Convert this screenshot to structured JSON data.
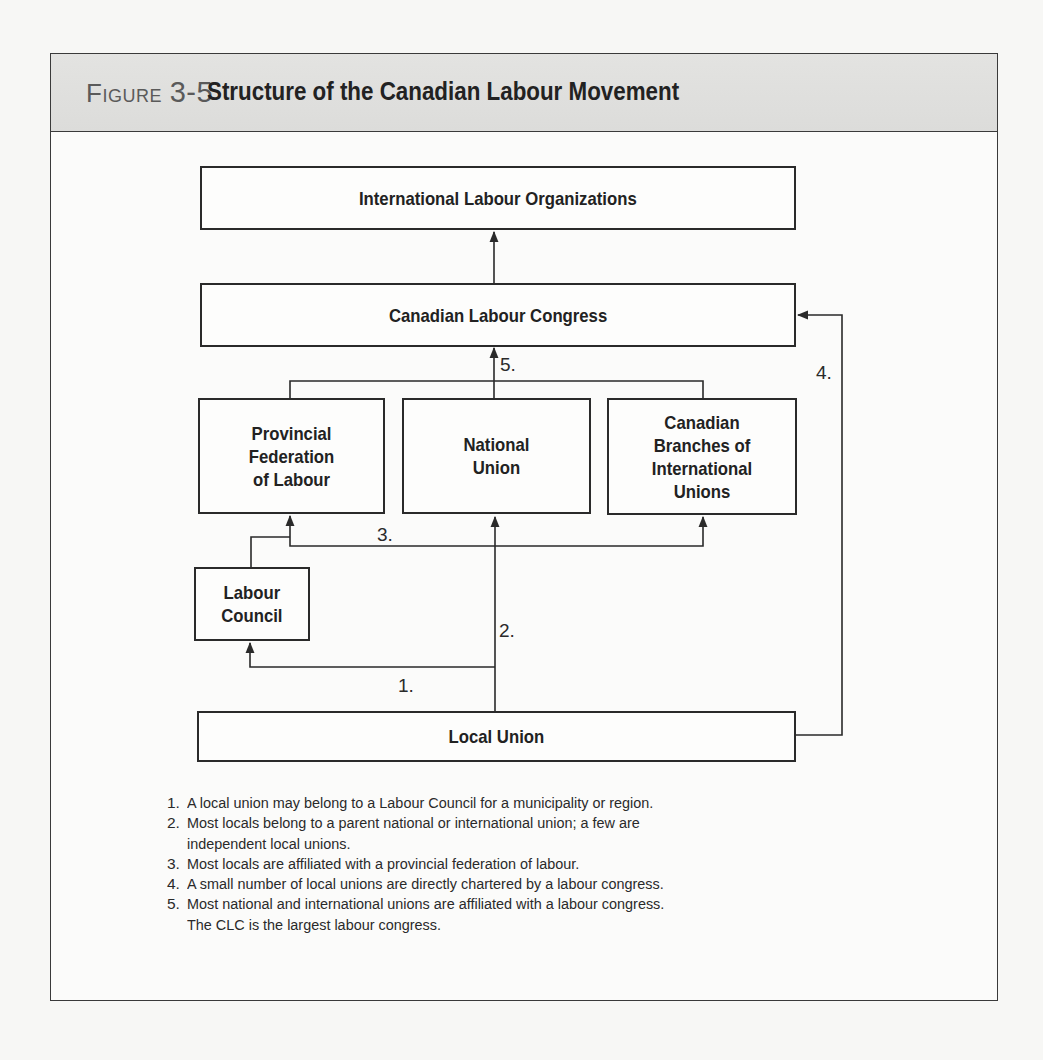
{
  "figure": {
    "label": "Figure",
    "number": "3-5",
    "title": "Structure of the Canadian Labour Movement"
  },
  "colors": {
    "header_bg": "#dedede",
    "line": "#2a2a2a",
    "label_gray": "#5a5a5a"
  },
  "nodes": {
    "international": "International Labour Organizations",
    "clc": "Canadian Labour Congress",
    "provincial": "Provincial\nFederation\nof Labour",
    "national": "National\nUnion",
    "branches": "Canadian\nBranches of\nInternational\nUnions",
    "council": "Labour\nCouncil",
    "local": "Local Union"
  },
  "edge_labels": {
    "e1": "1.",
    "e2": "2.",
    "e3": "3.",
    "e4": "4.",
    "e5": "5."
  },
  "notes": [
    {
      "num": "1.",
      "lines": [
        "A local union may belong to a Labour Council for a municipality or region."
      ]
    },
    {
      "num": "2.",
      "lines": [
        "Most locals belong to a parent national or international union; a few are",
        "independent local unions."
      ]
    },
    {
      "num": "3.",
      "lines": [
        "Most locals are affiliated with a provincial federation of labour."
      ]
    },
    {
      "num": "4.",
      "lines": [
        "A small number of local unions are directly chartered by a labour congress."
      ]
    },
    {
      "num": "5.",
      "lines": [
        "Most national and international unions are affiliated with a labour congress.",
        "The CLC is the largest labour congress."
      ]
    }
  ]
}
